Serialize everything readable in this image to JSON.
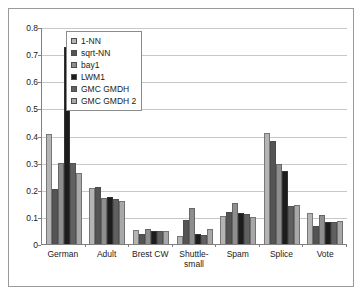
{
  "chart_data": {
    "type": "bar",
    "title": "",
    "xlabel": "",
    "ylabel": "",
    "ylim": [
      0,
      0.8
    ],
    "ytick_labels": [
      "0.8",
      "0.7",
      "0.6",
      "0.5",
      "0.4",
      "0.3",
      "0.2",
      "0.1",
      "0"
    ],
    "ytick_values": [
      0.8,
      0.7,
      0.6,
      0.5,
      0.4,
      0.3,
      0.2,
      0.1,
      0
    ],
    "grid": true,
    "legend_position": "upper-left-inside",
    "categories": [
      "German",
      "Adult",
      "Brest CW",
      "Shuttle-small",
      "Spam",
      "Splice",
      "Vote"
    ],
    "series": [
      {
        "name": "1-NN",
        "color": "#b4b4b4",
        "values": [
          0.406,
          0.207,
          0.05,
          0.031,
          0.105,
          0.41,
          0.114
        ]
      },
      {
        "name": "sqrt-NN",
        "color": "#545454",
        "values": [
          0.203,
          0.212,
          0.037,
          0.088,
          0.117,
          0.381,
          0.068
        ]
      },
      {
        "name": "bay1",
        "color": "#8e8e8e",
        "values": [
          0.299,
          0.168,
          0.056,
          0.133,
          0.151,
          0.295,
          0.107
        ]
      },
      {
        "name": "LWM1",
        "color": "#1c1c1c",
        "values": [
          0.727,
          0.173,
          0.048,
          0.037,
          0.114,
          0.269,
          0.083
        ]
      },
      {
        "name": "GMC GMDH",
        "color": "#606060",
        "values": [
          0.297,
          0.167,
          0.047,
          0.032,
          0.11,
          0.139,
          0.08
        ]
      },
      {
        "name": "GMC GMDH 2",
        "color": "#a8a8a8",
        "values": [
          0.263,
          0.16,
          0.047,
          0.054,
          0.099,
          0.143,
          0.086
        ]
      }
    ]
  },
  "legend": {
    "items": [
      {
        "label": "1-NN"
      },
      {
        "label": "sqrt-NN"
      },
      {
        "label": "bay1"
      },
      {
        "label": "LWM1"
      },
      {
        "label": "GMC GMDH"
      },
      {
        "label": "GMC GMDH 2"
      }
    ]
  }
}
